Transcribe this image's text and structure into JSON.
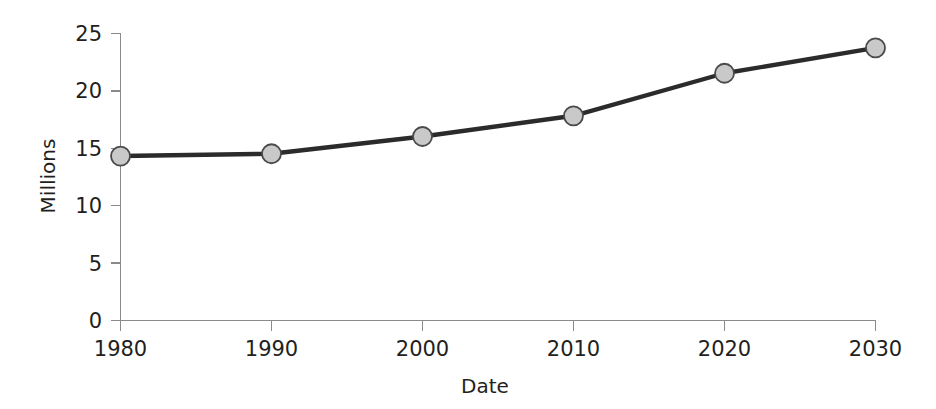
{
  "chart_data": {
    "type": "line",
    "title": "",
    "xlabel": "Date",
    "ylabel": "Millions",
    "x": [
      1980,
      1990,
      2000,
      2010,
      2020,
      2030
    ],
    "categories": [
      "1980",
      "1990",
      "2000",
      "2010",
      "2020",
      "2030"
    ],
    "values": [
      14.3,
      14.5,
      16.0,
      17.8,
      21.5,
      23.7
    ],
    "series": [
      {
        "name": "Millions",
        "values": [
          14.3,
          14.5,
          16.0,
          17.8,
          21.5,
          23.7
        ]
      }
    ],
    "xlim": [
      1980,
      2030
    ],
    "ylim": [
      0,
      25
    ],
    "yticks": [
      0,
      5,
      10,
      15,
      20,
      25
    ],
    "ytick_labels": [
      "0",
      "5",
      "10",
      "15",
      "20",
      "25"
    ],
    "xticks": [
      1980,
      1990,
      2000,
      2010,
      2020,
      2030
    ],
    "xtick_labels": [
      "1980",
      "1990",
      "2000",
      "2010",
      "2020",
      "2030"
    ],
    "grid": false,
    "legend": false,
    "legend_position": "none",
    "marker": "circle",
    "colors": {
      "line": "#2b2b2b",
      "marker_fill": "#c9c9c9",
      "marker_edge": "#4a4a4a",
      "axis": "#8a8a8a",
      "text": "#231f20",
      "background": "#ffffff"
    }
  },
  "axes": {
    "y": {
      "label": "Millions",
      "ticks": [
        {
          "label": "25",
          "value": 25
        },
        {
          "label": "20",
          "value": 20
        },
        {
          "label": "15",
          "value": 15
        },
        {
          "label": "10",
          "value": 10
        },
        {
          "label": "5",
          "value": 5
        },
        {
          "label": "0",
          "value": 0
        }
      ]
    },
    "x": {
      "label": "Date",
      "ticks": [
        {
          "label": "1980",
          "value": 1980
        },
        {
          "label": "1990",
          "value": 1990
        },
        {
          "label": "2000",
          "value": 2000
        },
        {
          "label": "2010",
          "value": 2010
        },
        {
          "label": "2020",
          "value": 2020
        },
        {
          "label": "2030",
          "value": 2030
        }
      ]
    }
  }
}
